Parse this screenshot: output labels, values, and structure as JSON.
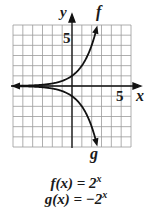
{
  "chart_data": {
    "type": "line",
    "title": "",
    "xlabel": "x",
    "ylabel": "y",
    "xlim": [
      -6,
      6
    ],
    "ylim": [
      -6,
      6
    ],
    "grid": true,
    "tick_labels": {
      "x": [
        "5"
      ],
      "y": [
        "5"
      ]
    },
    "series": [
      {
        "name": "f",
        "equation": "f(x) = 2^x",
        "x": [
          -6,
          -4,
          -2,
          -1,
          0,
          1,
          2,
          2.5
        ],
        "y": [
          0.016,
          0.0625,
          0.25,
          0.5,
          1,
          2,
          4,
          5.66
        ]
      },
      {
        "name": "g",
        "equation": "g(x) = -2^x",
        "x": [
          -6,
          -4,
          -2,
          -1,
          0,
          1,
          2,
          2.5
        ],
        "y": [
          -0.016,
          -0.0625,
          -0.25,
          -0.5,
          -1,
          -2,
          -4,
          -5.66
        ]
      }
    ]
  },
  "labels": {
    "x_axis": "x",
    "y_axis": "y",
    "x_tick": "5",
    "y_tick": "5",
    "curve_f": "f",
    "curve_g": "g"
  },
  "equations": {
    "f_lhs": "f(x) = 2",
    "f_exp": "x",
    "g_lhs": "g(x) = −2",
    "g_exp": "x"
  }
}
